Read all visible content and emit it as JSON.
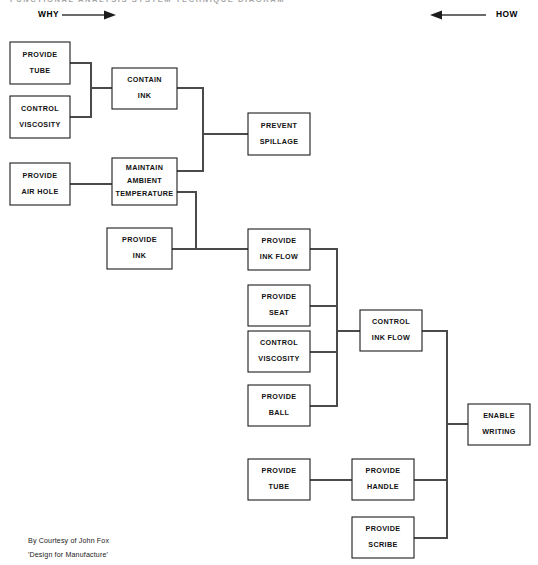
{
  "page": {
    "clipped_header_text": "FUNCTIONAL ANALYSIS SYSTEM TECHNIQUE DIAGRAM",
    "background_color": "#ffffff",
    "line_color": "#4a4a4a",
    "box_stroke_color": "#1d1d1d",
    "text_color": "#111111"
  },
  "axis": {
    "why_label": "WHY",
    "how_label": "HOW",
    "why_arrow_direction": "right",
    "how_arrow_direction": "left"
  },
  "credit": {
    "line1": "By Courtesy of John Fox",
    "line2": "'Design for Manufacture'"
  },
  "nodes": [
    {
      "id": "provide-tube-left",
      "line1": "PROVIDE",
      "line2": "TUBE",
      "line3": "",
      "x": 10,
      "y": 42,
      "w": 60,
      "h": 42
    },
    {
      "id": "control-viscosity-left",
      "line1": "CONTROL",
      "line2": "VISCOSITY",
      "line3": "",
      "x": 10,
      "y": 96,
      "w": 60,
      "h": 42
    },
    {
      "id": "contain-ink",
      "line1": "CONTAIN",
      "line2": "INK",
      "line3": "",
      "x": 112,
      "y": 68,
      "w": 65,
      "h": 41
    },
    {
      "id": "provide-air-hole",
      "line1": "PROVIDE",
      "line2": "AIR HOLE",
      "line3": "",
      "x": 10,
      "y": 163,
      "w": 60,
      "h": 42
    },
    {
      "id": "maintain-ambient-temp",
      "line1": "MAINTAIN",
      "line2": "AMBIENT",
      "line3": "TEMPERATURE",
      "x": 112,
      "y": 158,
      "w": 65,
      "h": 47
    },
    {
      "id": "prevent-spillage",
      "line1": "PREVENT",
      "line2": "SPILLAGE",
      "line3": "",
      "x": 248,
      "y": 113,
      "w": 62,
      "h": 42
    },
    {
      "id": "provide-ink",
      "line1": "PROVIDE",
      "line2": "INK",
      "line3": "",
      "x": 107,
      "y": 228,
      "w": 65,
      "h": 41
    },
    {
      "id": "provide-ink-flow",
      "line1": "PROVIDE",
      "line2": "INK FLOW",
      "line3": "",
      "x": 248,
      "y": 229,
      "w": 62,
      "h": 41
    },
    {
      "id": "provide-seat",
      "line1": "PROVIDE",
      "line2": "SEAT",
      "line3": "",
      "x": 248,
      "y": 285,
      "w": 62,
      "h": 41
    },
    {
      "id": "control-viscosity-mid",
      "line1": "CONTROL",
      "line2": "VISCOSITY",
      "line3": "",
      "x": 248,
      "y": 331,
      "w": 62,
      "h": 41
    },
    {
      "id": "provide-ball",
      "line1": "PROVIDE",
      "line2": "BALL",
      "line3": "",
      "x": 248,
      "y": 385,
      "w": 62,
      "h": 41
    },
    {
      "id": "control-ink-flow",
      "line1": "CONTROL",
      "line2": "INK FLOW",
      "line3": "",
      "x": 360,
      "y": 310,
      "w": 62,
      "h": 41
    },
    {
      "id": "enable-writing",
      "line1": "ENABLE",
      "line2": "WRITING",
      "line3": "",
      "x": 468,
      "y": 404,
      "w": 62,
      "h": 41
    },
    {
      "id": "provide-tube-bottom",
      "line1": "PROVIDE",
      "line2": "TUBE",
      "line3": "",
      "x": 248,
      "y": 459,
      "w": 62,
      "h": 41
    },
    {
      "id": "provide-handle",
      "line1": "PROVIDE",
      "line2": "HANDLE",
      "line3": "",
      "x": 352,
      "y": 459,
      "w": 62,
      "h": 41
    },
    {
      "id": "provide-scribe",
      "line1": "PROVIDE",
      "line2": "SCRIBE",
      "line3": "",
      "x": 352,
      "y": 517,
      "w": 62,
      "h": 41
    }
  ],
  "connectors": [
    {
      "id": "tube-to-bus1",
      "points": "70,63 91,63 91,88"
    },
    {
      "id": "viscosity-to-bus1",
      "points": "70,117 91,117 91,88"
    },
    {
      "id": "bus1-to-contain-ink",
      "points": "91,88 112,88"
    },
    {
      "id": "contain-ink-to-bus2",
      "points": "177,88 203,88 203,134"
    },
    {
      "id": "bus2-to-prevent-spillage",
      "points": "203,134 248,134"
    },
    {
      "id": "temp-to-bus2",
      "points": "177,171 203,171 203,134"
    },
    {
      "id": "airhole-to-temp",
      "points": "70,184 112,184"
    },
    {
      "id": "temp-to-bus3",
      "points": "177,192 196,192 196,249"
    },
    {
      "id": "provide-ink-to-bus3",
      "points": "172,249 196,249"
    },
    {
      "id": "bus3-to-ink-flow",
      "points": "196,249 248,249"
    },
    {
      "id": "ink-flow-to-bus4",
      "points": "310,249 337,249 337,331"
    },
    {
      "id": "seat-to-bus4",
      "points": "310,306 337,306 337,331"
    },
    {
      "id": "viscosity-mid-to-bus4",
      "points": "310,352 337,352 337,331"
    },
    {
      "id": "ball-to-bus4",
      "points": "310,406 337,406 337,331"
    },
    {
      "id": "bus4-to-control-ink-flow",
      "points": "337,331 360,331"
    },
    {
      "id": "control-ink-flow-to-bus5",
      "points": "422,331 447,331 447,424"
    },
    {
      "id": "bus5-to-enable-writing",
      "points": "447,424 468,424"
    },
    {
      "id": "tube-bottom-to-handle",
      "points": "310,480 352,480"
    },
    {
      "id": "handle-to-bus5",
      "points": "414,480 447,480 447,424"
    },
    {
      "id": "scribe-to-bus5",
      "points": "414,538 447,538 447,424"
    }
  ]
}
